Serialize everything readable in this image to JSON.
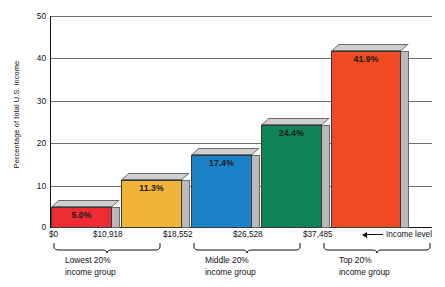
{
  "chart_data": {
    "type": "bar",
    "title": "",
    "subtitle": "",
    "xlabel": "Income level",
    "ylabel": "Percentage of total U.S. income",
    "ylim": [
      0,
      50
    ],
    "yticks": [
      0,
      10,
      20,
      30,
      40,
      50
    ],
    "grid": true,
    "legend": "none",
    "categories": [
      "$0 - $10,918",
      "$10,918 - $18,552",
      "$18,552 - $26,528",
      "$26,528 - $37,485",
      "$37,485 and above"
    ],
    "values": [
      5.0,
      11.3,
      17.4,
      24.4,
      41.9
    ],
    "data_labels": [
      "5.0%",
      "11.3%",
      "17.4%",
      "24.4%",
      "41.9%"
    ],
    "bar_colors": [
      "#ED2B33",
      "#F0B43A",
      "#1C82C8",
      "#0F8257",
      "#F04A22"
    ],
    "boundaries": [
      "$0",
      "$10,918",
      "$18,552",
      "$26,528",
      "$37,485"
    ],
    "annotations": [
      "Income level"
    ],
    "group_brackets": [
      {
        "label_line1": "Lowest 20%",
        "label_line2": "income group"
      },
      {
        "label_line1": "Middle 20%",
        "label_line2": "income group"
      },
      {
        "label_line1": "Top 20%",
        "label_line2": "income group"
      }
    ]
  },
  "axis": {
    "y_title": "Percentage of total U.S. income",
    "y_ticks": [
      "50",
      "40",
      "30",
      "20",
      "10",
      "0"
    ],
    "x_tick_labels": [
      "$0",
      "$10,918",
      "$18,552",
      "$26,528",
      "$37,485"
    ],
    "x_annotation": "Income level"
  },
  "bars": [
    {
      "label": "5.0%",
      "value": 5.0,
      "color": "#ED2B33"
    },
    {
      "label": "11.3%",
      "value": 11.3,
      "color": "#F0B43A"
    },
    {
      "label": "17.4%",
      "value": 17.4,
      "color": "#1C82C8"
    },
    {
      "label": "24.4%",
      "value": 24.4,
      "color": "#0F8257"
    },
    {
      "label": "41.9%",
      "value": 41.9,
      "color": "#F04A22"
    }
  ],
  "groups": [
    {
      "line1": "Lowest 20%",
      "line2": "income group"
    },
    {
      "line1": "Middle 20%",
      "line2": "income group"
    },
    {
      "line1": "Top 20%",
      "line2": "income group"
    }
  ]
}
